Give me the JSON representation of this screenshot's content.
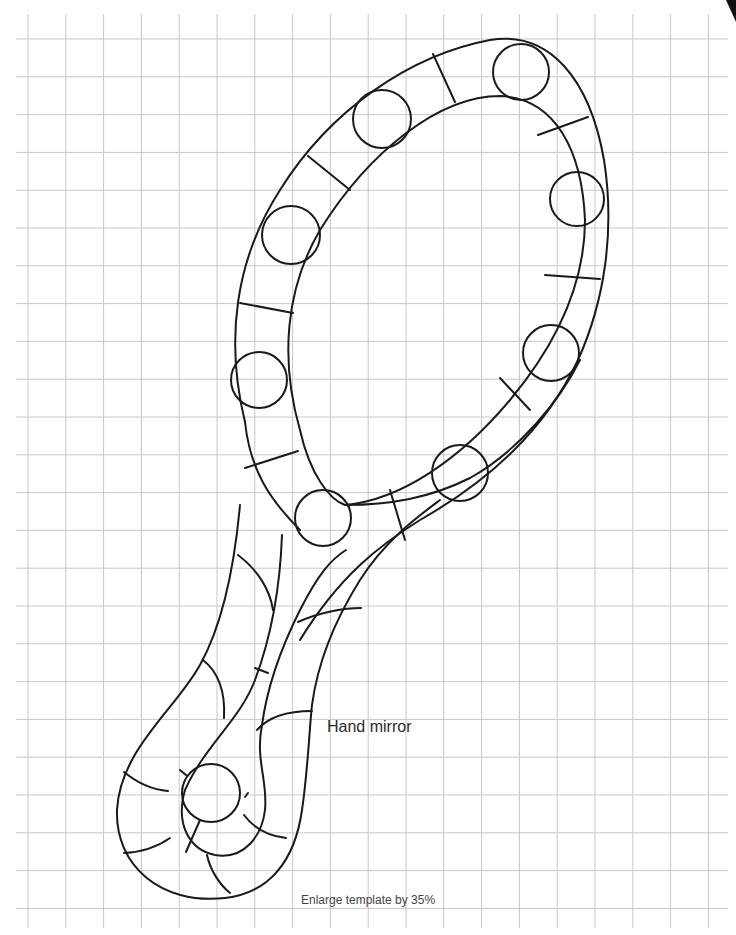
{
  "template": {
    "title": "Hand mirror",
    "note": "Enlarge template by 35%",
    "enlarge_percent": 35
  },
  "grid": {
    "cell_size_px": 37.8,
    "line_color": "#c8c8c8",
    "x_start": 16,
    "x_end": 728,
    "y_start": 14,
    "y_end": 928
  },
  "pattern": {
    "stroke_color": "#1a1a1a",
    "jewel_circle_count": 9,
    "parts": [
      "mirror-frame-outer",
      "mirror-glass-inner",
      "frame-dividers",
      "jewel-circles",
      "handle-left-strand",
      "handle-right-strand",
      "handle-loop"
    ]
  },
  "colors": {
    "background": "#ffffff",
    "line": "#1a1a1a",
    "grid": "#c8c8c8",
    "text": "#2a2a2a"
  }
}
